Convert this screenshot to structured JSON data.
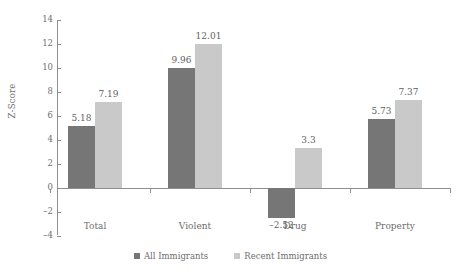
{
  "chart_data": {
    "type": "bar",
    "title": "",
    "xlabel": "",
    "ylabel": "Z-Score",
    "ylim": [
      -4,
      14
    ],
    "yticks": [
      14,
      12,
      10,
      8,
      6,
      4,
      2,
      0,
      -2,
      -4
    ],
    "ytick_labels": [
      "14",
      "12",
      "10",
      "8",
      "6",
      "4",
      "2",
      "0",
      "–2",
      "–4"
    ],
    "grid": false,
    "legend_position": "bottom",
    "categories": [
      "Total",
      "Violent",
      "Drug",
      "Property"
    ],
    "series": [
      {
        "name": "All Immigrants",
        "color": "#767676",
        "values": [
          5.18,
          9.96,
          -2.52,
          5.73
        ],
        "labels": [
          "5.18",
          "9.96",
          "–2.52",
          "5.73"
        ]
      },
      {
        "name": "Recent Immigrants",
        "color": "#c9c9c9",
        "values": [
          7.19,
          12.01,
          3.3,
          7.37
        ],
        "labels": [
          "7.19",
          "12.01",
          "3.3",
          "7.37"
        ]
      }
    ]
  },
  "legend": {
    "items": [
      {
        "label": "All Immigrants",
        "swatch": "dark"
      },
      {
        "label": "Recent Immigrants",
        "swatch": "light"
      }
    ]
  },
  "axis": {
    "y_title": "Z-Score"
  }
}
